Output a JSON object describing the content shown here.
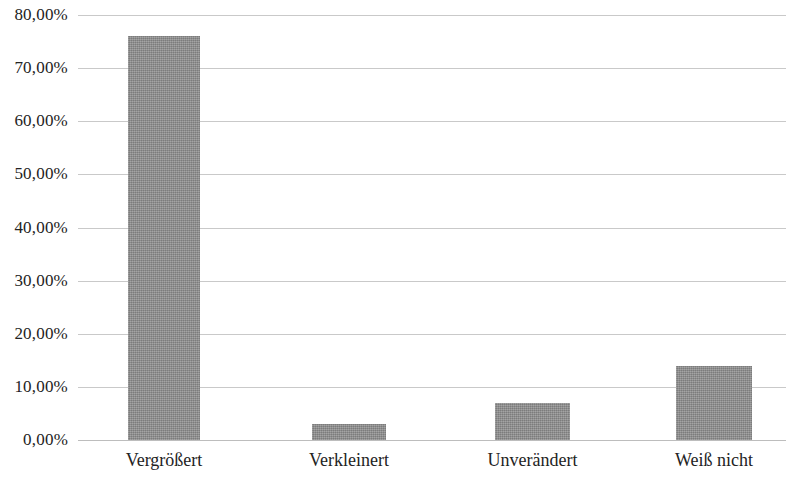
{
  "chart_data": {
    "type": "bar",
    "title": "",
    "subtitle": "",
    "xlabel": "",
    "ylabel": "",
    "categories": [
      "Vergrößert",
      "Verkleinert",
      "Unverändert",
      "Weiß nicht"
    ],
    "values": [
      76.0,
      3.0,
      7.0,
      14.0
    ],
    "value_labels": [
      "76,00%",
      "3,00%",
      "7,00%",
      "14,00%"
    ],
    "series": [
      {
        "name": "",
        "values": [
          76.0,
          3.0,
          7.0,
          14.0
        ]
      }
    ],
    "ylim": [
      0,
      80
    ],
    "ytick_values": [
      0,
      10,
      20,
      30,
      40,
      50,
      60,
      70,
      80
    ],
    "ytick_labels": [
      "0,00%",
      "10,00%",
      "20,00%",
      "30,00%",
      "40,00%",
      "50,00%",
      "60,00%",
      "70,00%",
      "80,00%"
    ],
    "grid": true,
    "grid_axis": "y",
    "legend": false,
    "legend_position": "none",
    "bar_color": "#8d8d8d",
    "grid_color": "#c9c9c9",
    "axis_color": "#bdbdbd",
    "text_color": "#232323",
    "background_color": "#ffffff",
    "annotations": []
  },
  "axis": {
    "y": {
      "ticks": [
        {
          "label": "80,00%",
          "value": 80
        },
        {
          "label": "70,00%",
          "value": 70
        },
        {
          "label": "60,00%",
          "value": 60
        },
        {
          "label": "50,00%",
          "value": 50
        },
        {
          "label": "40,00%",
          "value": 40
        },
        {
          "label": "30,00%",
          "value": 30
        },
        {
          "label": "20,00%",
          "value": 20
        },
        {
          "label": "10,00%",
          "value": 10
        },
        {
          "label": "0,00%",
          "value": 0
        }
      ]
    },
    "x": {
      "ticks": [
        {
          "label": "Vergrößert"
        },
        {
          "label": "Verkleinert"
        },
        {
          "label": "Unverändert"
        },
        {
          "label": "Weiß nicht"
        }
      ]
    }
  }
}
